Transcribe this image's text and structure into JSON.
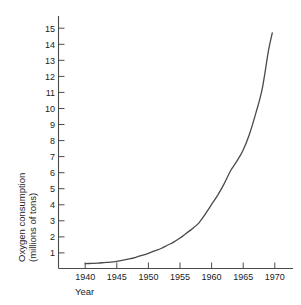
{
  "chart_data": {
    "type": "line",
    "title": "",
    "xlabel": "Year",
    "ylabel": "Oxygen consumption (millions of tons)",
    "ylabel_line1": "Oxygen consumption",
    "ylabel_line2": "(millions of tons)",
    "xlim": [
      1938,
      1972
    ],
    "ylim": [
      0,
      15.4
    ],
    "grid": false,
    "legend": null,
    "series_color": "#4a4a4a",
    "background_color": "#ffffff",
    "xticks": [
      1940,
      1945,
      1950,
      1955,
      1960,
      1965,
      1970
    ],
    "xtick_labels": [
      "1940",
      "1945",
      "1950",
      "1955",
      "1960",
      "1965",
      "1970"
    ],
    "yticks": [
      1,
      2,
      3,
      4,
      5,
      6,
      7,
      8,
      9,
      10,
      11,
      12,
      13,
      14,
      15
    ],
    "ytick_labels": [
      "1",
      "2",
      "3",
      "4",
      "5",
      "6",
      "7",
      "8",
      "9",
      "10",
      "11",
      "12",
      "13",
      "14",
      "15"
    ],
    "x": [
      1940,
      1941,
      1942,
      1943,
      1944,
      1945,
      1946,
      1947,
      1948,
      1949,
      1950,
      1951,
      1952,
      1953,
      1954,
      1955,
      1956,
      1957,
      1958,
      1959,
      1960,
      1961,
      1962,
      1963,
      1964,
      1965,
      1966,
      1967,
      1968,
      1969,
      1969.6
    ],
    "values": [
      0.3,
      0.32,
      0.34,
      0.37,
      0.4,
      0.45,
      0.52,
      0.6,
      0.7,
      0.82,
      0.95,
      1.1,
      1.25,
      1.45,
      1.65,
      1.9,
      2.2,
      2.5,
      2.85,
      3.4,
      4.0,
      4.6,
      5.3,
      6.1,
      6.7,
      7.4,
      8.4,
      9.7,
      11.2,
      13.6,
      14.7
    ],
    "annotations": []
  },
  "axis": {
    "y_title_line1": "Oxygen consumption",
    "y_title_line2": "(millions of tons)",
    "x_title": "Year"
  }
}
